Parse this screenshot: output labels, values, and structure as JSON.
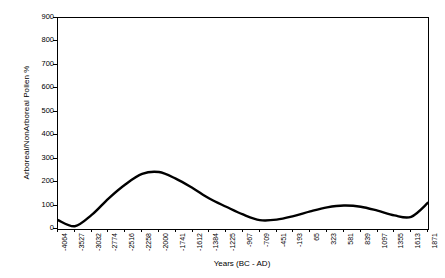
{
  "chart_data": {
    "type": "line",
    "title": "",
    "xlabel": "Years (BC - AD)",
    "ylabel": "Arboreal/NonArboreal Pollen %",
    "ylim": [
      0,
      900
    ],
    "ytick_values": [
      0,
      100,
      200,
      300,
      400,
      500,
      600,
      700,
      800,
      900
    ],
    "ytick_labels": [
      "0",
      "100",
      "200",
      "300",
      "400",
      "500",
      "600",
      "700",
      "800",
      "900"
    ],
    "grid": false,
    "legend": null,
    "line_color": "#000000",
    "axis_color": "#000000",
    "background_color": "#ffffff",
    "categories": [
      "-4064",
      "-3527",
      "-3032",
      "-2774",
      "-2516",
      "-2258",
      "-2000",
      "-1741",
      "-1612",
      "-1384",
      "-1225",
      "-967",
      "-709",
      "-451",
      "-193",
      "65",
      "323",
      "581",
      "839",
      "1097",
      "1355",
      "1613",
      "1871"
    ],
    "series": [
      {
        "name": "Arboreal/NonArboreal Pollen %",
        "values": [
          38,
          12,
          60,
          130,
          190,
          235,
          243,
          215,
          175,
          130,
          95,
          62,
          38,
          40,
          55,
          75,
          92,
          100,
          95,
          78,
          58,
          52,
          112
        ]
      }
    ]
  }
}
